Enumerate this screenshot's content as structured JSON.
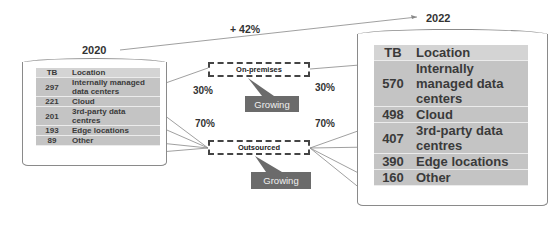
{
  "growth_label": "+ 42%",
  "left": {
    "year": "2020",
    "header": {
      "tb": "TB",
      "location": "Location"
    },
    "rows": [
      {
        "tb": "297",
        "location": "Internally managed data centers",
        "loc_line1": "Internally managed",
        "loc_line2": "data centers"
      },
      {
        "tb": "221",
        "location": "Cloud"
      },
      {
        "tb": "201",
        "location": "3rd-party data centres",
        "loc_line1": "3rd-party data",
        "loc_line2": "centres"
      },
      {
        "tb": "193",
        "location": "Edge locations"
      },
      {
        "tb": "89",
        "location": "Other"
      }
    ],
    "onprem_pct": "30%",
    "outsourced_pct": "70%"
  },
  "right": {
    "year": "2022",
    "header": {
      "tb": "TB",
      "location": "Location"
    },
    "rows": [
      {
        "tb": "570",
        "location": "Internally managed data centers",
        "loc_line1": "Internally",
        "loc_line2": "managed data",
        "loc_line3": "centers"
      },
      {
        "tb": "498",
        "location": "Cloud"
      },
      {
        "tb": "407",
        "location": "3rd-party data centres",
        "loc_line1": "3rd-party data",
        "loc_line2": "centres"
      },
      {
        "tb": "390",
        "location": "Edge locations"
      },
      {
        "tb": "160",
        "location": "Other"
      }
    ],
    "onprem_pct": "30%",
    "outsourced_pct": "70%"
  },
  "categories": {
    "onprem": "On-premises",
    "outsourced": "Outsourced"
  },
  "callouts": {
    "onprem": "Growing",
    "outsourced": "Growing"
  },
  "colors": {
    "table_header": "#d4d4d4",
    "table_cell": "#c4c4c4",
    "callout_bg": "#6b6b6b",
    "line": "#8a8a8a"
  }
}
